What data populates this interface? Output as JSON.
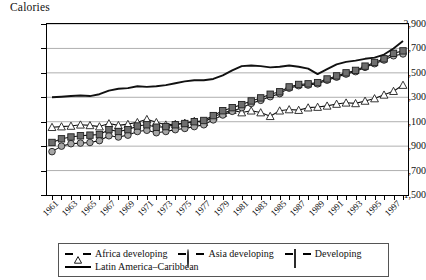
{
  "chart_data": {
    "type": "line",
    "title": "Calories",
    "xlabel": "",
    "ylabel": "Calories",
    "ylim": [
      1500,
      2900
    ],
    "yticks": [
      "1,500",
      "1,700",
      "1,900",
      "2,100",
      "2,300",
      "2,500",
      "2,700",
      "2,900"
    ],
    "ytick_values": [
      1500,
      1700,
      1900,
      2100,
      2300,
      2500,
      2700,
      2900
    ],
    "grid": true,
    "legend_position": "bottom",
    "x": [
      1961,
      1962,
      1963,
      1964,
      1965,
      1966,
      1967,
      1968,
      1969,
      1970,
      1971,
      1972,
      1973,
      1974,
      1975,
      1976,
      1977,
      1978,
      1979,
      1980,
      1981,
      1982,
      1983,
      1984,
      1985,
      1986,
      1987,
      1988,
      1989,
      1990,
      1991,
      1992,
      1993,
      1994,
      1995,
      1996,
      1997,
      1998
    ],
    "xtick_labels": [
      "1961",
      "",
      "1963",
      "",
      "1965",
      "",
      "1967",
      "",
      "1969",
      "",
      "1971",
      "",
      "1973",
      "",
      "1975",
      "",
      "1977",
      "",
      "1979",
      "",
      "1981",
      "",
      "1983",
      "",
      "1985",
      "",
      "1987",
      "",
      "1989",
      "",
      "1991",
      "",
      "1993",
      "",
      "1995",
      "",
      "1997",
      ""
    ],
    "series": [
      {
        "name": "Africa developing",
        "marker": "triangle-open",
        "color": "#1a1a1a",
        "fill": "#ffffff",
        "values": [
          2055,
          2060,
          2065,
          2075,
          2070,
          2060,
          2085,
          2070,
          2080,
          2095,
          2120,
          2095,
          2075,
          2080,
          2090,
          2105,
          2095,
          2140,
          2170,
          2195,
          2175,
          2190,
          2175,
          2145,
          2190,
          2200,
          2195,
          2215,
          2220,
          2230,
          2245,
          2255,
          2250,
          2270,
          2290,
          2320,
          2350,
          2400
        ]
      },
      {
        "name": "Asia developing",
        "marker": "circle",
        "color": "#a6a6a6",
        "fill": "#a6a6a6",
        "values": [
          1855,
          1900,
          1920,
          1925,
          1930,
          1945,
          1985,
          1975,
          1990,
          2020,
          2030,
          2010,
          2020,
          2035,
          2045,
          2060,
          2075,
          2115,
          2155,
          2185,
          2215,
          2250,
          2275,
          2305,
          2330,
          2375,
          2395,
          2400,
          2410,
          2440,
          2465,
          2490,
          2510,
          2545,
          2575,
          2605,
          2640,
          2655
        ]
      },
      {
        "name": "Developing",
        "marker": "square",
        "color": "#6e6e6e",
        "fill": "#6e6e6e",
        "values": [
          1930,
          1960,
          1975,
          1985,
          1990,
          1995,
          2035,
          2020,
          2035,
          2065,
          2075,
          2055,
          2060,
          2075,
          2085,
          2100,
          2110,
          2150,
          2190,
          2215,
          2240,
          2270,
          2295,
          2325,
          2345,
          2385,
          2405,
          2410,
          2420,
          2450,
          2475,
          2500,
          2520,
          2555,
          2585,
          2615,
          2660,
          2680
        ]
      },
      {
        "name": "Latin America–Caribbean",
        "marker": "none",
        "color": "#000000",
        "fill": "#000000",
        "values": [
          2300,
          2305,
          2310,
          2315,
          2310,
          2325,
          2355,
          2370,
          2375,
          2390,
          2385,
          2390,
          2400,
          2415,
          2430,
          2440,
          2440,
          2450,
          2480,
          2520,
          2555,
          2560,
          2555,
          2545,
          2550,
          2560,
          2550,
          2535,
          2490,
          2530,
          2570,
          2590,
          2600,
          2615,
          2625,
          2650,
          2700,
          2760
        ]
      }
    ]
  },
  "legend": {
    "items": [
      {
        "label": "Africa developing",
        "marker": "triangle-open-icon"
      },
      {
        "label": "Asia developing",
        "marker": "circle-icon"
      },
      {
        "label": "Developing",
        "marker": "square-icon"
      },
      {
        "label": "Latin America–Caribbean",
        "marker": "solid-line-icon"
      }
    ]
  }
}
